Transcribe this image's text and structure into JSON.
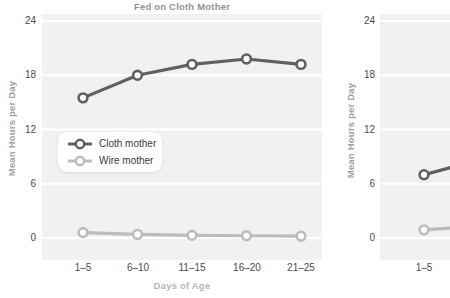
{
  "colors": {
    "plot_background": "#f2f1ef",
    "gridline": "#ffffff",
    "cloth_line": "#606060",
    "wire_line": "#bcbcbc",
    "marker_fill": "#fdfdfd",
    "title_text": "#949290",
    "tick_text": "#4b4b4b"
  },
  "chart_data": [
    {
      "type": "line",
      "title": "Fed on Cloth Mother",
      "xlabel": "Days of Age",
      "ylabel": "Mean Hours per Day",
      "categories": [
        "1–5",
        "6–10",
        "11–15",
        "16–20",
        "21–25"
      ],
      "series": [
        {
          "name": "Cloth mother",
          "values": [
            15.5,
            18,
            19.2,
            19.8,
            19.2
          ],
          "color": "#606060"
        },
        {
          "name": "Wire mother",
          "values": [
            0.6,
            0.4,
            0.3,
            0.25,
            0.2
          ],
          "color": "#bcbcbc"
        }
      ],
      "ylim": [
        0,
        24
      ],
      "yticks": [
        24,
        18,
        12,
        6,
        0
      ],
      "grid": "horizontal",
      "legend_position": "middle-left"
    },
    {
      "type": "line",
      "title": "",
      "xlabel": "",
      "ylabel": "Mean Hours per Day",
      "categories": [
        "1–5"
      ],
      "clipped_right": true,
      "series": [
        {
          "name": "Cloth mother",
          "values": [
            7
          ],
          "edge_value": 7.8,
          "color": "#606060"
        },
        {
          "name": "Wire mother",
          "values": [
            0.9
          ],
          "edge_value": 1.1,
          "color": "#bcbcbc"
        }
      ],
      "ylim": [
        0,
        24
      ],
      "yticks": [
        24,
        18,
        12,
        6,
        0
      ],
      "grid": "horizontal",
      "legend_position": "none"
    }
  ]
}
